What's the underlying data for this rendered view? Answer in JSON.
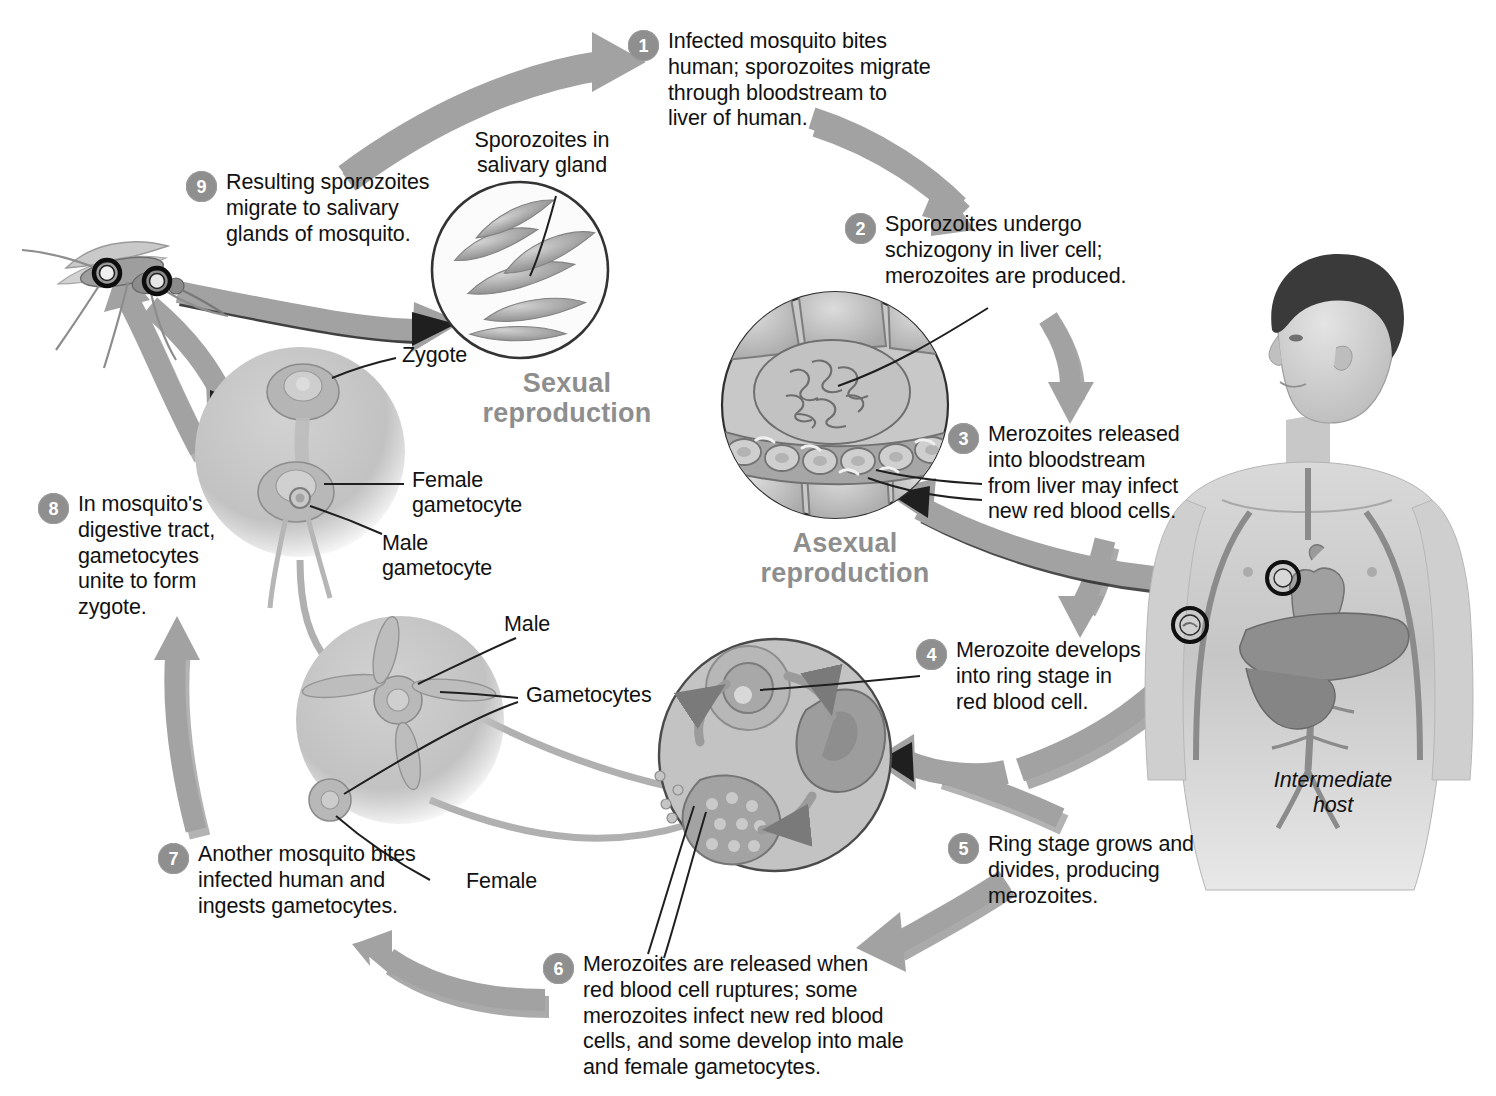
{
  "diagram": {
    "accent_grey": "#8f8f8f",
    "arrow_grey": "#9a9a9a",
    "text_color": "#111111"
  },
  "steps": [
    {
      "number": "1",
      "text": "Infected mosquito bites\nhuman; sporozoites migrate\nthrough bloodstream to\nliver of human."
    },
    {
      "number": "2",
      "text": "Sporozoites undergo\nschizogony in liver cell;\nmerozoites are produced."
    },
    {
      "number": "3",
      "text": "Merozoites released\ninto bloodstream\nfrom liver may infect\nnew red blood cells."
    },
    {
      "number": "4",
      "text": "Merozoite develops\ninto ring stage in\nred blood cell."
    },
    {
      "number": "5",
      "text": "Ring stage grows and\ndivides, producing\nmerozoites."
    },
    {
      "number": "6",
      "text": "Merozoites are released when\nred blood cell ruptures; some\nmerozoites infect new red blood\ncells, and some develop into male\nand female gametocytes."
    },
    {
      "number": "7",
      "text": "Another mosquito bites\ninfected human and\ningests gametocytes."
    },
    {
      "number": "8",
      "text": "In mosquito's\ndigestive tract,\ngametocytes\nunite to form\nzygote."
    },
    {
      "number": "9",
      "text": "Resulting sporozoites\nmigrate to salivary\nglands of mosquito."
    }
  ],
  "headings": [
    {
      "id": "sexual",
      "text": "Sexual\nreproduction"
    },
    {
      "id": "asexual",
      "text": "Asexual\nreproduction"
    }
  ],
  "labels": [
    {
      "id": "sporozoites-salivary-gland",
      "text": "Sporozoites in\nsalivary gland"
    },
    {
      "id": "zygote",
      "text": "Zygote"
    },
    {
      "id": "female-gametocyte",
      "text": "Female\ngametocyte"
    },
    {
      "id": "male-gametocyte",
      "text": "Male\ngametocyte"
    },
    {
      "id": "male",
      "text": "Male"
    },
    {
      "id": "gametocytes",
      "text": "Gametocytes"
    },
    {
      "id": "female",
      "text": "Female"
    },
    {
      "id": "intermediate-host",
      "text": "Intermediate\nhost"
    }
  ]
}
